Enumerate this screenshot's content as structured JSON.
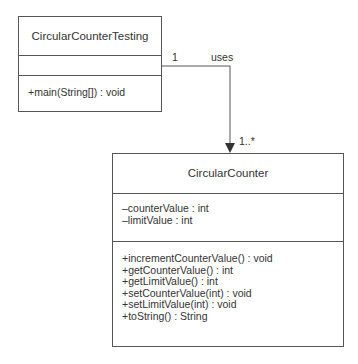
{
  "diagram": {
    "type": "UML class diagram",
    "classes": [
      {
        "name": "CircularCounterTesting",
        "attributes": [],
        "methods": [
          "+main(String[]) : void"
        ]
      },
      {
        "name": "CircularCounter",
        "attributes": [
          "–counterValue : int",
          "–limitValue : int"
        ],
        "methods": [
          "+incrementCounterValue() : void",
          "+getCounterValue() : int",
          "+getLimitValue() : int",
          "+setCounterValue(int) : void",
          "+setLimitValue(int) : void",
          "+toString() : String"
        ]
      }
    ],
    "association": {
      "from": "CircularCounterTesting",
      "to": "CircularCounter",
      "label": "uses",
      "source_multiplicity": "1",
      "target_multiplicity": "1..*",
      "line_color": "#555555"
    }
  }
}
